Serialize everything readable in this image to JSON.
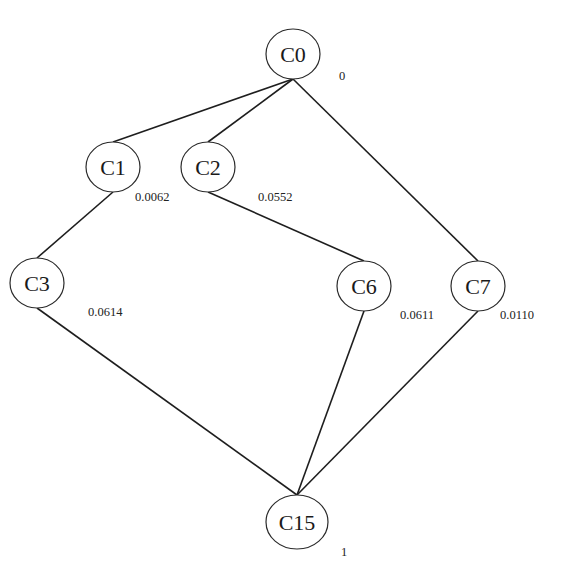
{
  "diagram": {
    "type": "lattice",
    "nodes": [
      {
        "id": "C0",
        "label": "C0",
        "weight": "0",
        "cx": 293,
        "cy": 54,
        "rx": 27,
        "ry": 25,
        "wx": 339,
        "wy": 80
      },
      {
        "id": "C1",
        "label": "C1",
        "weight": "0.0062",
        "cx": 113,
        "cy": 167,
        "rx": 27,
        "ry": 25,
        "wx": 135,
        "wy": 201
      },
      {
        "id": "C2",
        "label": "C2",
        "weight": "0.0552",
        "cx": 208,
        "cy": 167,
        "rx": 27,
        "ry": 25,
        "wx": 258,
        "wy": 201
      },
      {
        "id": "C3",
        "label": "C3",
        "weight": "0.0614",
        "cx": 37,
        "cy": 283,
        "rx": 27,
        "ry": 25,
        "wx": 88,
        "wy": 316
      },
      {
        "id": "C6",
        "label": "C6",
        "weight": "0.0611",
        "cx": 364,
        "cy": 286,
        "rx": 27,
        "ry": 25,
        "wx": 400,
        "wy": 319
      },
      {
        "id": "C7",
        "label": "C7",
        "weight": "0.0110",
        "cx": 478,
        "cy": 286,
        "rx": 27,
        "ry": 25,
        "wx": 500,
        "wy": 319
      },
      {
        "id": "C15",
        "label": "C15",
        "weight": "1",
        "cx": 297,
        "cy": 522,
        "rx": 31,
        "ry": 27,
        "wx": 341,
        "wy": 556
      }
    ],
    "edges": [
      {
        "from": "C0",
        "to": "C1"
      },
      {
        "from": "C0",
        "to": "C2"
      },
      {
        "from": "C0",
        "to": "C7"
      },
      {
        "from": "C1",
        "to": "C3"
      },
      {
        "from": "C2",
        "to": "C6"
      },
      {
        "from": "C3",
        "to": "C15"
      },
      {
        "from": "C6",
        "to": "C15"
      },
      {
        "from": "C7",
        "to": "C15"
      }
    ],
    "colors": {
      "background": "#ffffff",
      "stroke": "#1e1e1e",
      "text": "#1a1a1a"
    }
  }
}
